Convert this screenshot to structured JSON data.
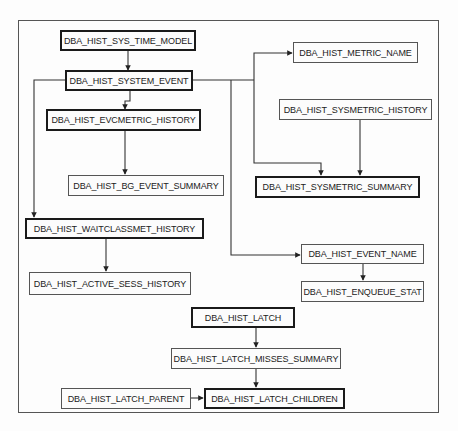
{
  "diagram": {
    "nodes": [
      {
        "id": "sys_time_model",
        "label": "DBA_HIST_SYS_TIME_MODEL",
        "emphasis": "thick"
      },
      {
        "id": "system_event",
        "label": "DBA_HIST_SYSTEM_EVENT",
        "emphasis": "thick"
      },
      {
        "id": "evcmetric_history",
        "label": "DBA_HIST_EVCMETRIC_HISTORY",
        "emphasis": "thick"
      },
      {
        "id": "bg_event_summary",
        "label": "DBA_HIST_BG_EVENT_SUMMARY",
        "emphasis": "thin"
      },
      {
        "id": "waitclassmet_history",
        "label": "DBA_HIST_WAITCLASSMET_HISTORY",
        "emphasis": "thick"
      },
      {
        "id": "active_sess_history",
        "label": "DBA_HIST_ACTIVE_SESS_HISTORY",
        "emphasis": "thin"
      },
      {
        "id": "metric_name",
        "label": "DBA_HIST_METRIC_NAME",
        "emphasis": "thin"
      },
      {
        "id": "sysmetric_history",
        "label": "DBA_HIST_SYSMETRIC_HISTORY",
        "emphasis": "thin"
      },
      {
        "id": "sysmetric_summary",
        "label": "DBA_HIST_SYSMETRIC_SUMMARY",
        "emphasis": "thick"
      },
      {
        "id": "event_name",
        "label": "DBA_HIST_EVENT_NAME",
        "emphasis": "thin"
      },
      {
        "id": "enqueue_stat",
        "label": "DBA_HIST_ENQUEUE_STAT",
        "emphasis": "thin"
      },
      {
        "id": "latch",
        "label": "DBA_HIST_LATCH",
        "emphasis": "thick"
      },
      {
        "id": "latch_misses_summary",
        "label": "DBA_HIST_LATCH_MISSES_SUMMARY",
        "emphasis": "thin"
      },
      {
        "id": "latch_parent",
        "label": "DBA_HIST_LATCH_PARENT",
        "emphasis": "thin"
      },
      {
        "id": "latch_children",
        "label": "DBA_HIST_LATCH_CHILDREN",
        "emphasis": "thick"
      }
    ],
    "edges": [
      {
        "from": "sys_time_model",
        "to": "system_event"
      },
      {
        "from": "system_event",
        "to": "evcmetric_history"
      },
      {
        "from": "system_event",
        "to": "waitclassmet_history"
      },
      {
        "from": "system_event",
        "to": "metric_name"
      },
      {
        "from": "system_event",
        "to": "sysmetric_summary"
      },
      {
        "from": "system_event",
        "to": "event_name"
      },
      {
        "from": "evcmetric_history",
        "to": "bg_event_summary"
      },
      {
        "from": "waitclassmet_history",
        "to": "active_sess_history"
      },
      {
        "from": "sysmetric_history",
        "to": "sysmetric_summary"
      },
      {
        "from": "event_name",
        "to": "enqueue_stat"
      },
      {
        "from": "latch",
        "to": "latch_misses_summary"
      },
      {
        "from": "latch_misses_summary",
        "to": "latch_children"
      },
      {
        "from": "latch_parent",
        "to": "latch_children"
      }
    ]
  }
}
